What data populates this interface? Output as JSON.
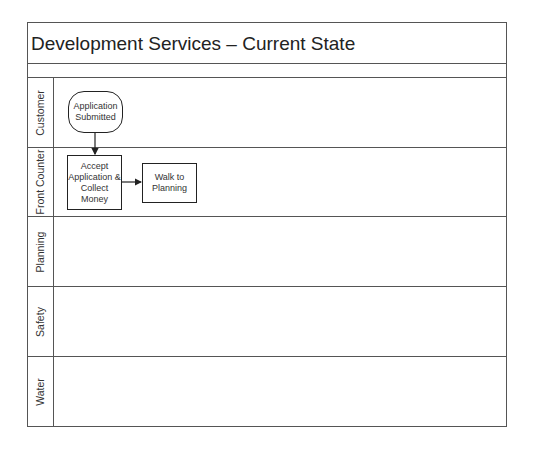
{
  "diagram": {
    "title": "Development Services – Current State",
    "lanes": [
      {
        "label": "Customer"
      },
      {
        "label": "Front Counter"
      },
      {
        "label": "Planning"
      },
      {
        "label": "Safety"
      },
      {
        "label": "Water"
      }
    ],
    "shapes": [
      {
        "id": "application-submitted",
        "type": "terminator",
        "lane": "Customer",
        "text": "Application Submitted"
      },
      {
        "id": "accept-application",
        "type": "process",
        "lane": "Front Counter",
        "text": "Accept Application & Collect Money"
      },
      {
        "id": "walk-to-planning",
        "type": "process",
        "lane": "Front Counter",
        "text": "Walk to Planning"
      }
    ],
    "connectors": [
      {
        "from": "application-submitted",
        "to": "accept-application"
      },
      {
        "from": "accept-application",
        "to": "walk-to-planning"
      }
    ],
    "colors": {
      "line": "#555555",
      "shape_border": "#222222",
      "text": "#222222",
      "background": "#ffffff"
    }
  }
}
